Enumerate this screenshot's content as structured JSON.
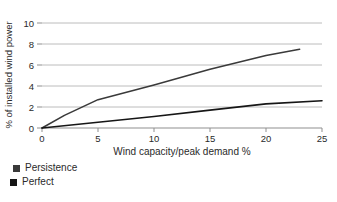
{
  "figure": {
    "legend": [
      {
        "label": "Persistence",
        "color": "#3a3a3a"
      },
      {
        "label": "Perfect",
        "color": "#161616"
      }
    ]
  },
  "chart_data": {
    "type": "line",
    "title": "",
    "xlabel": "Wind capacity/peak demand %",
    "ylabel": "% of installed wind power",
    "xlim": [
      0,
      25
    ],
    "ylim": [
      0,
      10
    ],
    "xticks": [
      0,
      5,
      10,
      15,
      20,
      25
    ],
    "yticks": [
      0,
      2,
      4,
      6,
      8,
      10
    ],
    "grid": "horizontal",
    "legend_position": "bottom-left",
    "series": [
      {
        "name": "Persistence",
        "color": "#3a3a3a",
        "points": [
          [
            0,
            0
          ],
          [
            2,
            1.2
          ],
          [
            5,
            2.7
          ],
          [
            10,
            4.1
          ],
          [
            15,
            5.6
          ],
          [
            20,
            6.9
          ],
          [
            23,
            7.5
          ]
        ]
      },
      {
        "name": "Perfect",
        "color": "#161616",
        "points": [
          [
            0,
            0
          ],
          [
            5,
            0.55
          ],
          [
            10,
            1.1
          ],
          [
            15,
            1.7
          ],
          [
            20,
            2.3
          ],
          [
            25,
            2.6
          ]
        ]
      }
    ]
  }
}
